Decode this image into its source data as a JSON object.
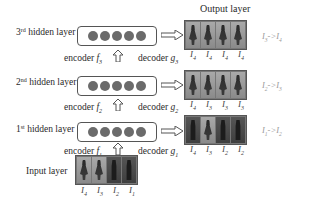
{
  "diagram": {
    "output_layer_title": "Output layer",
    "input_layer_label": "Input layer",
    "hidden_layers": [
      {
        "ordinal": "3",
        "suffix": "rd",
        "label": "hidden layer",
        "neurons": 5
      },
      {
        "ordinal": "2",
        "suffix": "nd",
        "label": "hidden layer",
        "neurons": 5
      },
      {
        "ordinal": "1",
        "suffix": "st",
        "label": "hidden layer",
        "neurons": 5
      }
    ],
    "encoders": [
      {
        "label": "encoder",
        "fn": "f",
        "sub": "3"
      },
      {
        "label": "encoder",
        "fn": "f",
        "sub": "2"
      },
      {
        "label": "encoder",
        "fn": "f",
        "sub": "1"
      }
    ],
    "decoders": [
      {
        "label": "decoder",
        "fn": "g",
        "sub": "3"
      },
      {
        "label": "decoder",
        "fn": "g",
        "sub": "2"
      },
      {
        "label": "decoder",
        "fn": "g",
        "sub": "1"
      }
    ],
    "output_rows": [
      {
        "frame_labels": [
          "4",
          "4",
          "4",
          "4"
        ],
        "relation": {
          "from": "3",
          "to": "4"
        },
        "frames": [
          "light",
          "light",
          "light",
          "light"
        ]
      },
      {
        "frame_labels": [
          "4",
          "3",
          "3",
          "3"
        ],
        "relation": {
          "from": "2",
          "to": "3"
        },
        "frames": [
          "light",
          "light",
          "light",
          "light"
        ]
      },
      {
        "frame_labels": [
          "4",
          "3",
          "2",
          "2"
        ],
        "relation": {
          "from": "1",
          "to": "2"
        },
        "frames": [
          "dark",
          "light",
          "dark",
          "dark"
        ]
      }
    ],
    "input_row": {
      "frame_labels": [
        "4",
        "3",
        "2",
        "1"
      ],
      "frames": [
        "light",
        "light",
        "dark",
        "dark"
      ]
    },
    "frame_var": "I",
    "relation_symbol": "->"
  }
}
